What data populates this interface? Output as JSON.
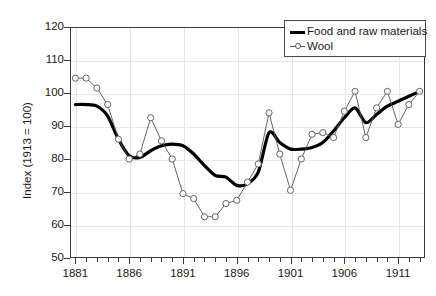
{
  "chart_data": {
    "type": "line",
    "title": "",
    "xlabel": "",
    "ylabel": "Index (1913 = 100)",
    "xlim": [
      1880.5,
      1913.5
    ],
    "ylim": [
      50,
      120
    ],
    "ytick_values": [
      50,
      60,
      70,
      80,
      90,
      100,
      110,
      120
    ],
    "ytick_labels": [
      "50",
      "60",
      "70",
      "80",
      "90",
      "100",
      "110",
      "120"
    ],
    "xtick_values": [
      1881,
      1886,
      1891,
      1896,
      1901,
      1906,
      1911
    ],
    "xtick_labels": [
      "1881",
      "1886",
      "1891",
      "1896",
      "1901",
      "1906",
      "1911"
    ],
    "xtick_minor_values": [
      1882,
      1883,
      1884,
      1885,
      1887,
      1888,
      1889,
      1890,
      1892,
      1893,
      1894,
      1895,
      1897,
      1898,
      1899,
      1900,
      1902,
      1903,
      1904,
      1905,
      1907,
      1908,
      1909,
      1910,
      1912,
      1913
    ],
    "grid": "both",
    "legend_position": "top-right",
    "x": [
      1881,
      1882,
      1883,
      1884,
      1885,
      1886,
      1887,
      1888,
      1889,
      1890,
      1891,
      1892,
      1893,
      1894,
      1895,
      1896,
      1897,
      1898,
      1899,
      1900,
      1901,
      1902,
      1903,
      1904,
      1905,
      1906,
      1907,
      1908,
      1909,
      1910,
      1911,
      1912,
      1913
    ],
    "series": [
      {
        "name": "Food and raw materials",
        "color": "#000000",
        "style": "thick-line",
        "marker": "none",
        "values": [
          96.5,
          96.5,
          96.0,
          93.0,
          86.0,
          81.0,
          80.5,
          82.5,
          84.0,
          84.5,
          84.0,
          81.5,
          78.0,
          75.0,
          74.5,
          72.0,
          72.5,
          76.0,
          88.0,
          85.0,
          83.0,
          83.0,
          83.5,
          85.0,
          88.5,
          92.5,
          95.5,
          91.0,
          93.5,
          96.0,
          97.5,
          99.0,
          100.5
        ]
      },
      {
        "name": "Wool",
        "color": "#555555",
        "style": "thin-line-with-markers",
        "marker": "circle",
        "values": [
          104.5,
          104.5,
          101.5,
          96.5,
          86.0,
          80.0,
          81.5,
          92.5,
          85.5,
          80.0,
          69.5,
          68.0,
          62.5,
          62.5,
          66.5,
          67.5,
          73.0,
          78.5,
          94.0,
          81.5,
          70.5,
          80.0,
          87.5,
          88.0,
          86.5,
          94.5,
          100.5,
          86.5,
          95.5,
          100.5,
          90.5,
          96.5,
          100.5
        ]
      }
    ]
  },
  "axis": {
    "y_title": "Index (1913 = 100)"
  },
  "legend": {
    "items": [
      {
        "label": "Food and raw materials",
        "symbol": "thick-line"
      },
      {
        "label": "Wool",
        "symbol": "circle-marker-line"
      }
    ]
  }
}
